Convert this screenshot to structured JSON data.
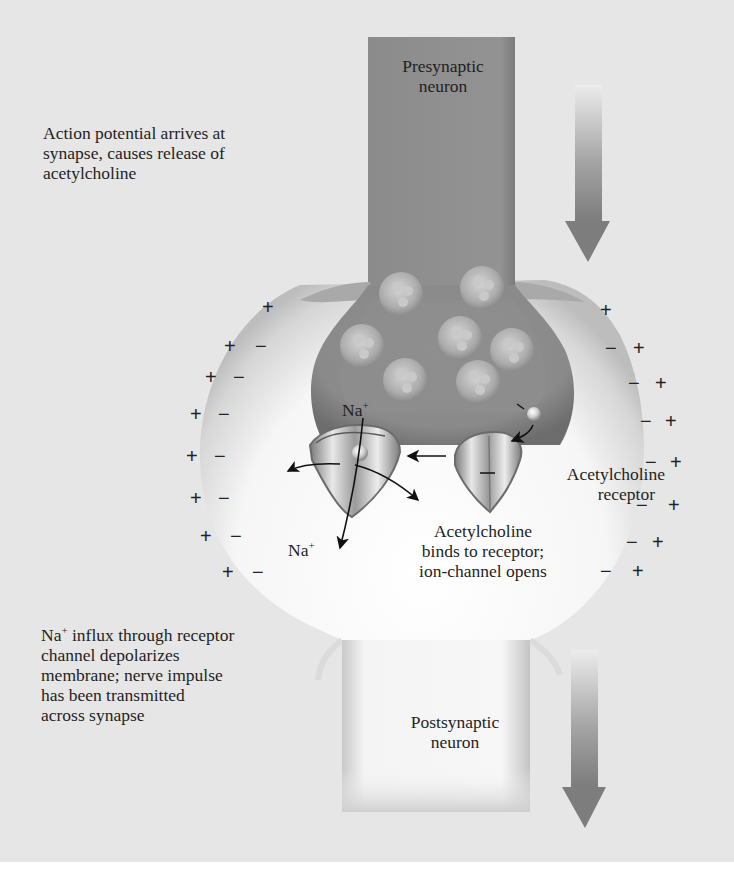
{
  "figure": {
    "type": "synapse-transmission-diagram",
    "colors": {
      "background": "#e6e6e6",
      "presynaptic_neuron": "#8f8f8f",
      "postsynaptic_neuron": "#f7f7f7",
      "vesicle": "#a9a9a9",
      "arrow_dark": "#7a7a7a",
      "text": "#1f1f1f"
    }
  },
  "labels": {
    "presynaptic": [
      "Presynaptic",
      "neuron"
    ],
    "postsynaptic": [
      "Postsynaptic",
      "neuron"
    ],
    "step1": [
      "Action potential arrives at",
      "synapse, causes release of",
      "acetylcholine"
    ],
    "step2": [
      "Acetylcholine",
      "binds to receptor;",
      "ion-channel opens"
    ],
    "step3_line1_prefix": "Na",
    "step3_line1_sup": "+",
    "step3_line1_suffix": " influx through receptor",
    "step3": [
      "channel depolarizes",
      "membrane; nerve impulse",
      "has been transmitted",
      "across synapse"
    ],
    "receptor": [
      "Acetylcholine",
      "receptor"
    ],
    "na_top": "Na",
    "na_bottom": "Na",
    "na_sup": "+"
  },
  "charges": {
    "plus": "+",
    "minus": "−",
    "left_outer_plus_count": 8,
    "left_inner_minus_count": 7,
    "right_outer_plus_count": 8,
    "right_inner_minus_count": 7
  },
  "vesicles": {
    "count": 7
  },
  "arrows": [
    {
      "name": "signal-direction-top",
      "direction": "down"
    },
    {
      "name": "signal-direction-bottom",
      "direction": "down"
    }
  ]
}
